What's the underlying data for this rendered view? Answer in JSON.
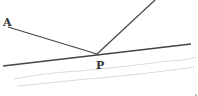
{
  "diagram": {
    "type": "light-reflection",
    "labels": {
      "a": "A",
      "p": "P"
    },
    "colors": {
      "ray": "#444444",
      "mirror": "#444444",
      "surface_texture": "#cccccc",
      "label": "#333333"
    },
    "points": {
      "A": [
        8,
        27
      ],
      "P": [
        97,
        54
      ],
      "reflected_end": [
        155,
        0
      ],
      "mirror_start": [
        3,
        66
      ],
      "mirror_end": [
        191,
        44
      ]
    }
  }
}
